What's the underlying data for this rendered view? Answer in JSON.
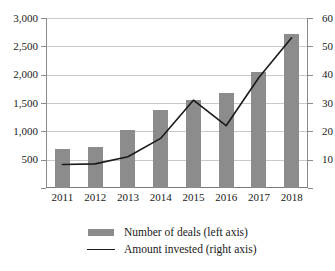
{
  "chart_data": {
    "type": "bar",
    "title": "",
    "subtitle": "",
    "xlabel": "",
    "categories": [
      "2011",
      "2012",
      "2013",
      "2014",
      "2015",
      "2016",
      "2017",
      "2018"
    ],
    "grid": true,
    "legend_position": "bottom",
    "series": [
      {
        "name": "Number of deals (left axis)",
        "type": "bar",
        "axis": "left",
        "color": "#8c8c8c",
        "values": [
          690,
          730,
          1020,
          1370,
          1550,
          1680,
          2050,
          2720
        ]
      },
      {
        "name": "Amount invested (right axis)",
        "type": "line",
        "axis": "right",
        "color": "#1a1a1a",
        "values": [
          8.3,
          8.5,
          11,
          17.5,
          31,
          22,
          39,
          53
        ]
      }
    ],
    "left_axis": {
      "label": "",
      "ylim": [
        0,
        3000
      ],
      "ticks": [
        0,
        500,
        1000,
        1500,
        2000,
        2500,
        3000
      ],
      "tick_labels": [
        "",
        "500",
        "1,000",
        "1,500",
        "2,000",
        "2,500",
        "3,000"
      ]
    },
    "right_axis": {
      "label": "",
      "ylim": [
        0,
        60
      ],
      "ticks": [
        0,
        10,
        20,
        30,
        40,
        50,
        60
      ],
      "tick_labels": [
        "",
        "10",
        "20",
        "30",
        "40",
        "50",
        "60"
      ]
    }
  },
  "legend": {
    "entries": [
      {
        "label": "Number of deals (left axis)",
        "marker": "bar-swatch-icon"
      },
      {
        "label": "Amount invested (right axis)",
        "marker": "line-swatch-icon"
      }
    ]
  }
}
